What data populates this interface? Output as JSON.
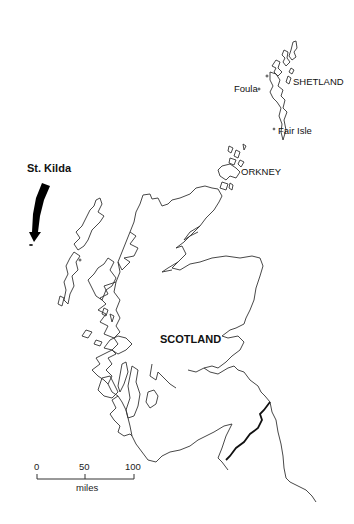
{
  "map": {
    "title": "Scotland and islands",
    "labels": {
      "shetland": "SHETLAND",
      "foula": "Foula",
      "fair_isle": "Fair Isle",
      "orkney": "ORKNEY",
      "st_kilda": "St. Kilda",
      "scotland": "SCOTLAND"
    },
    "scale_bar": {
      "ticks": [
        "0",
        "50",
        "100"
      ],
      "unit": "miles"
    },
    "colors": {
      "background": "#ffffff",
      "coastline": "#333333",
      "border": "#111111",
      "arrow": "#000000"
    }
  }
}
